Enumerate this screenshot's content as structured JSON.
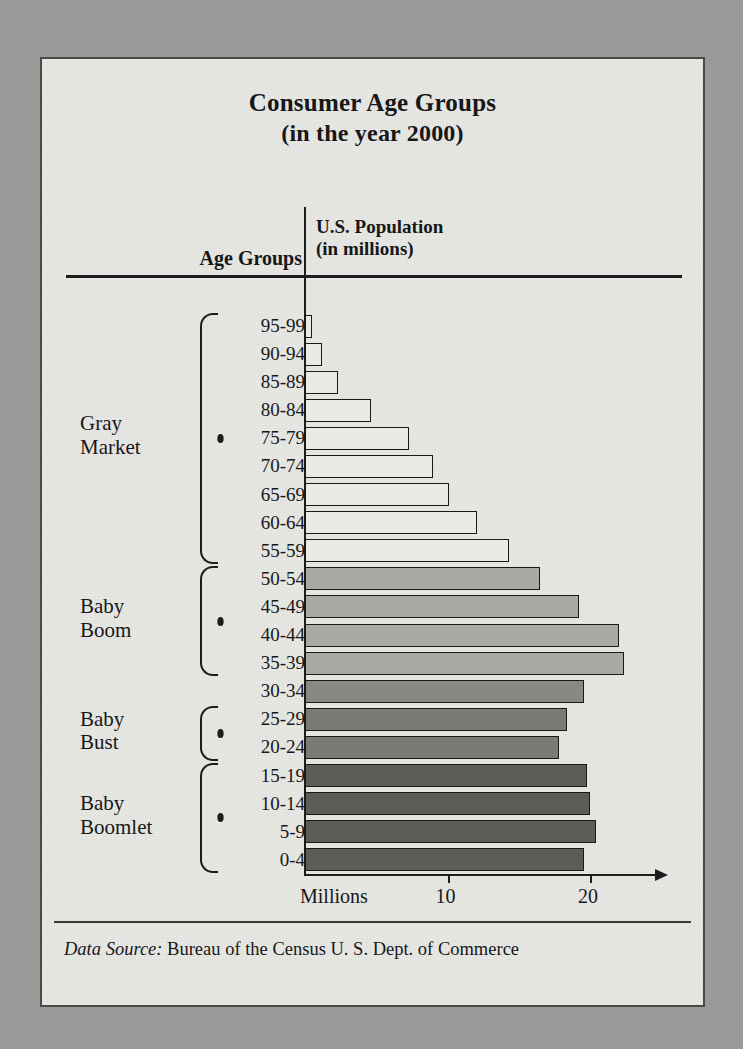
{
  "title": {
    "line1": "Consumer Age Groups",
    "line2": "(in the year 2000)"
  },
  "headers": {
    "age_groups": "Age Groups",
    "population_line1": "U.S. Population",
    "population_line2": "(in millions)"
  },
  "axis": {
    "caption": "Millions",
    "ticks": [
      "10",
      "20"
    ],
    "tick_values": [
      10,
      20
    ]
  },
  "groups": [
    {
      "name": "gray-market",
      "label_line1": "Gray",
      "label_line2": "Market",
      "from": "95-99",
      "to": "55-59"
    },
    {
      "name": "baby-boom",
      "label_line1": "Baby",
      "label_line2": "Boom",
      "from": "50-54",
      "to": "35-39"
    },
    {
      "name": "baby-bust",
      "label_line1": "Baby",
      "label_line2": "Bust",
      "from": "25-29",
      "to": "20-24"
    },
    {
      "name": "baby-boomlet",
      "label_line1": "Baby",
      "label_line2": "Boomlet",
      "from": "15-19",
      "to": "0-4"
    }
  ],
  "footer": {
    "source_label": "Data Source:",
    "source_text": "Bureau of the Census U. S. Dept. of Commerce"
  },
  "colors": {
    "gray_market": "#e9e9e5",
    "baby_boom": "#a9a9a5",
    "middle": "#888884",
    "baby_bust": "#7a7a76",
    "baby_boomlet": "#5c5c58",
    "outline": "#191919",
    "paper": "#e6e6e2",
    "backdrop": "#9a9a98"
  },
  "chart_data": {
    "type": "bar",
    "orientation": "horizontal",
    "title": "Consumer Age Groups (in the year 2000)",
    "xlabel": "U.S. Population (in millions)",
    "ylabel": "Age Groups",
    "xlim": [
      0,
      24
    ],
    "grid": false,
    "legend": false,
    "categories": [
      "95-99",
      "90-94",
      "85-89",
      "80-84",
      "75-79",
      "70-74",
      "65-69",
      "60-64",
      "55-59",
      "50-54",
      "45-49",
      "40-44",
      "35-39",
      "30-34",
      "25-29",
      "20-24",
      "15-19",
      "10-14",
      "5-9",
      "0-4"
    ],
    "values": [
      0.5,
      1.2,
      2.3,
      4.6,
      7.3,
      9.0,
      10.1,
      12.1,
      14.3,
      16.5,
      19.2,
      22.0,
      22.4,
      19.6,
      18.4,
      17.8,
      19.8,
      20.0,
      20.4,
      19.6
    ],
    "bar_groups": [
      "gray-market",
      "gray-market",
      "gray-market",
      "gray-market",
      "gray-market",
      "gray-market",
      "gray-market",
      "gray-market",
      "gray-market",
      "baby-boom",
      "baby-boom",
      "baby-boom",
      "baby-boom",
      "middle",
      "baby-bust",
      "baby-bust",
      "baby-boomlet",
      "baby-boomlet",
      "baby-boomlet",
      "baby-boomlet"
    ]
  }
}
